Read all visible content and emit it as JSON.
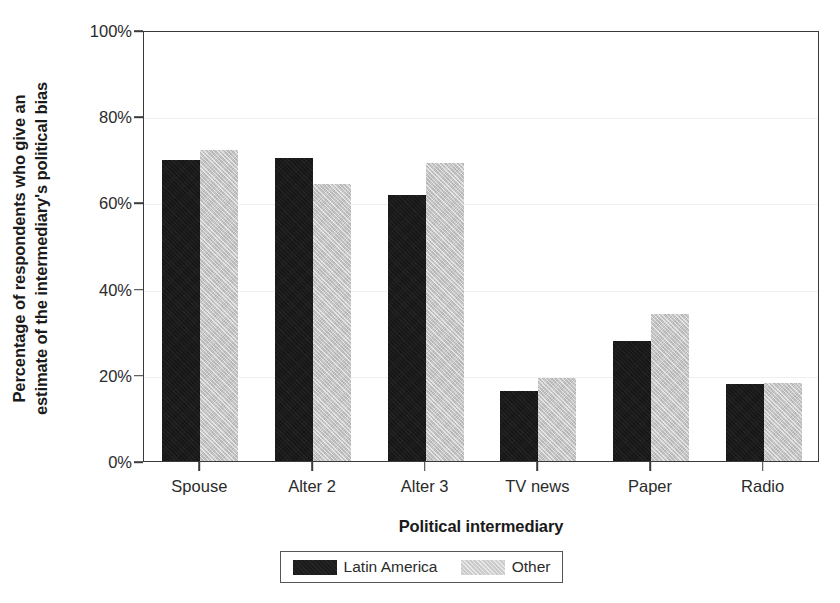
{
  "chart_data": {
    "type": "bar",
    "title": "",
    "xlabel": "Political intermediary",
    "ylabel": "Percentage of respondents who give an estimate of the intermediary's political bias",
    "ylabel_lines": [
      "Percentage of respondents who give an",
      "estimate of the intermediary's political bias"
    ],
    "categories": [
      "Spouse",
      "Alter 2",
      "Alter 3",
      "TV news",
      "Paper",
      "Radio"
    ],
    "series": [
      {
        "name": "Latin America",
        "color": "#1c1c1c",
        "values": [
          69.8,
          70.3,
          61.7,
          16.2,
          27.8,
          17.8
        ]
      },
      {
        "name": "Other",
        "color": "#c9c9c9",
        "values": [
          72.2,
          64.2,
          69.2,
          19.2,
          34.2,
          18.0
        ]
      }
    ],
    "ylim": [
      0,
      100
    ],
    "yticks": [
      0,
      20,
      40,
      60,
      80,
      100
    ],
    "ytick_labels": [
      "0%",
      "20%",
      "40%",
      "60%",
      "80%",
      "100%"
    ],
    "grid": true,
    "legend_position": "bottom",
    "units": "percent"
  },
  "legend": {
    "entries": [
      {
        "label": "Latin America",
        "swatch": "dark-swatch"
      },
      {
        "label": "Other",
        "swatch": "light-swatch"
      }
    ]
  }
}
